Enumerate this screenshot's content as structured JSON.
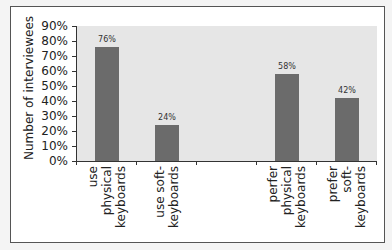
{
  "chart_data": {
    "type": "bar",
    "title": "",
    "xlabel": "",
    "ylabel": "Number of interviewees",
    "ylim": [
      0,
      90
    ],
    "yticks": [
      "0%",
      "10%",
      "20%",
      "30%",
      "40%",
      "50%",
      "60%",
      "70%",
      "80%",
      "90%"
    ],
    "categories": [
      "use physical keyboards",
      "use soft-keyboards",
      "",
      "perfer physical keyboards",
      "prefer soft-keyboards"
    ],
    "category_lines": [
      [
        "use",
        "physical",
        "keyboards"
      ],
      [
        "use soft-",
        "keyboards"
      ],
      [],
      [
        "perfer",
        "physical",
        "keyboards"
      ],
      [
        "prefer",
        "soft-",
        "keyboards"
      ]
    ],
    "values": [
      76,
      24,
      null,
      58,
      42
    ],
    "value_labels": [
      "76%",
      "24%",
      "",
      "58%",
      "42%"
    ],
    "grid": false,
    "legend": null,
    "bar_color": "#6b6b6b",
    "plot_background": "#e6e6e6"
  }
}
